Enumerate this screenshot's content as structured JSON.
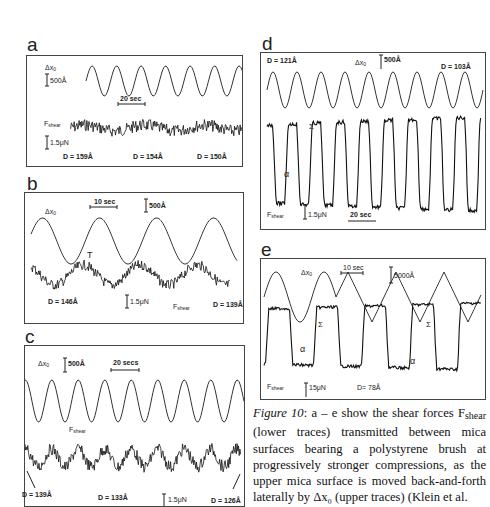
{
  "figure": {
    "number": "Figure 10",
    "caption_lead": "Figure 10",
    "caption_body": ": a – e show the shear forces F",
    "caption_sub": "shear",
    "caption_rest": " (lower traces) transmitted between mica surfaces bearing a polystyrene brush at progressively stronger compressions, as the upper mica surface is moved back-and-forth laterally by Δx₀ (upper traces) (Klein et al."
  },
  "panels": {
    "a": {
      "letter": "a",
      "dx_label": "Δx",
      "dx_sub": "0",
      "dx_scale": "500Å",
      "time_scale": "20 sec",
      "force_label": "F",
      "force_sub": "shear",
      "force_scale": "1.5μN",
      "d_labels": [
        "D = 159Å",
        "D = 154Å",
        "D = 150Å"
      ]
    },
    "b": {
      "letter": "b",
      "dx_label": "Δx",
      "dx_sub": "0",
      "time_scale": "10 sec",
      "dx_scale": "500Å",
      "marker": "T",
      "force_scale": "1.5μN",
      "force_label": "F",
      "force_sub": "shear",
      "d_labels": [
        "D = 146Å",
        "D = 139Å"
      ]
    },
    "c": {
      "letter": "c",
      "dx_label": "Δx",
      "dx_sub": "0",
      "dx_scale": "500Å",
      "time_scale": "20 secs",
      "force_label": "F",
      "force_sub": "shear",
      "force_scale": "1.5μN",
      "d_labels": [
        "D = 139Å",
        "D = 133Å",
        "D = 126Å"
      ]
    },
    "d": {
      "letter": "d",
      "d_labels": [
        "D = 121Å",
        "D = 103Å"
      ],
      "dx_label": "Δx",
      "dx_sub": "0",
      "dx_scale": "500Å",
      "marker_sigma": "Σ",
      "marker_alpha": "α",
      "force_label": "F",
      "force_sub": "shear",
      "force_scale": "1.5μN",
      "time_scale": "20 sec"
    },
    "e": {
      "letter": "e",
      "dx_label": "Δx",
      "dx_sub": "0",
      "time_scale": "10 sec",
      "dx_scale": "5000Å",
      "marker_sigma": "Σ",
      "marker_alpha": "α",
      "force_label": "F",
      "force_sub": "shear",
      "force_scale": "15μN",
      "d_label": "D= 78Å"
    }
  }
}
